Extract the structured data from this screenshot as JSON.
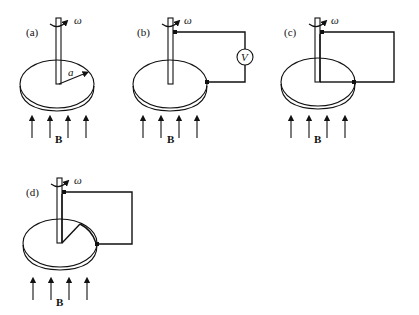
{
  "figure": {
    "panels": [
      {
        "id": "a",
        "label": "(a)",
        "omega": "ω",
        "radius_label": "a",
        "field_label": "B",
        "circuit": "none"
      },
      {
        "id": "b",
        "label": "(b)",
        "omega": "ω",
        "meter_label": "V",
        "field_label": "B",
        "circuit": "axle-to-rim via voltmeter"
      },
      {
        "id": "c",
        "label": "(c)",
        "omega": "ω",
        "field_label": "B",
        "circuit": "axle-to-rim wire loop along radius"
      },
      {
        "id": "d",
        "label": "(d)",
        "omega": "ω",
        "field_label": "B",
        "circuit": "axle-to-rim wire, bent radial path"
      }
    ],
    "colors": {
      "ink": "#111111",
      "background": "#ffffff"
    }
  }
}
